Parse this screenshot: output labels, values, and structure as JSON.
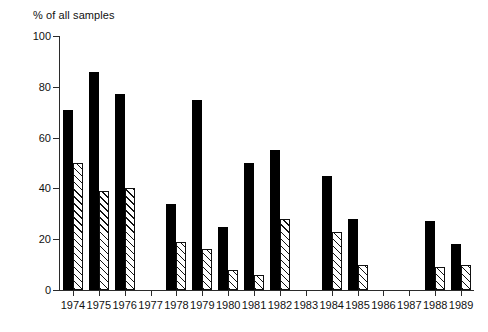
{
  "chart_data": {
    "type": "bar",
    "title": "% of all samples",
    "xlabel": "",
    "ylabel": "% of all samples",
    "ylim": [
      0,
      100
    ],
    "yticks": [
      0,
      20,
      40,
      60,
      80,
      100
    ],
    "grid": false,
    "legend": "none",
    "categories": [
      "1974",
      "1975",
      "1976",
      "1977",
      "1978",
      "1979",
      "1980",
      "1981",
      "1982",
      "1983",
      "1984",
      "1985",
      "1986",
      "1987",
      "1988",
      "1989"
    ],
    "series": [
      {
        "name": "solid",
        "style": "solid-black",
        "values": [
          71,
          86,
          77,
          null,
          34,
          75,
          25,
          50,
          55,
          null,
          45,
          28,
          null,
          null,
          27,
          18
        ]
      },
      {
        "name": "hatched",
        "style": "diagonal-hatch",
        "values": [
          50,
          39,
          40,
          null,
          19,
          16,
          8,
          6,
          28,
          null,
          23,
          10,
          null,
          null,
          9,
          10
        ]
      }
    ]
  },
  "axis": {
    "y_tick_labels": [
      "0",
      "20",
      "40",
      "60",
      "80",
      "100"
    ],
    "x_tick_labels": [
      "1974",
      "1975",
      "1976",
      "1977",
      "1978",
      "1979",
      "1980",
      "1981",
      "1982",
      "1983",
      "1984",
      "1985",
      "1986",
      "1987",
      "1988",
      "1989"
    ]
  },
  "colors": {
    "solid_bar": "#000000",
    "hatch_line": "#111111",
    "hatch_background": "#ffffff",
    "axis": "#2b2b2b",
    "text": "#111111",
    "page_background": "#ffffff"
  }
}
